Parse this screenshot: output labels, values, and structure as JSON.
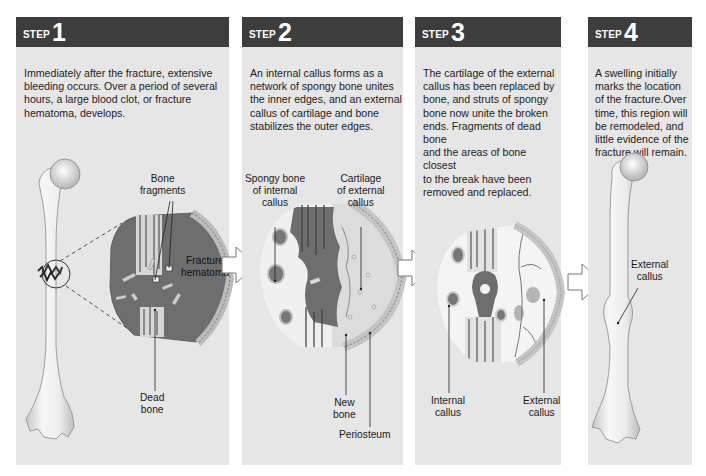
{
  "steps": [
    {
      "word": "STEP",
      "number": "1",
      "text_lines": [
        "Immediately after the fracture, extensive",
        "bleeding occurs. Over a period of several",
        "hours, a large blood clot, or fracture",
        "hematoma, develops."
      ],
      "labels": {
        "bone_fragments": [
          "Bone",
          "fragments"
        ],
        "fracture_hematoma": [
          "Fracture",
          "hematoma"
        ],
        "dead_bone": [
          "Dead",
          "bone"
        ]
      }
    },
    {
      "word": "STEP",
      "number": "2",
      "text_lines": [
        "An internal callus forms as a",
        "network of spongy bone unites",
        "the inner edges, and an external",
        "callus of cartilage and bone",
        "stabilizes the outer edges."
      ],
      "labels": {
        "spongy_bone": [
          "Spongy bone",
          "of internal",
          "callus"
        ],
        "cartilage": [
          "Cartilage",
          "of external",
          "callus"
        ],
        "new_bone": [
          "New",
          "bone"
        ],
        "periosteum": [
          "Periosteum"
        ]
      }
    },
    {
      "word": "STEP",
      "number": "3",
      "text_lines": [
        "The cartilage of the external",
        "callus has been replaced by",
        "bone, and struts of spongy",
        "bone now unite the broken",
        "ends. Fragments of dead bone",
        "and the areas of bone closest",
        "to the break have been",
        "removed and replaced."
      ],
      "labels": {
        "internal_callus": [
          "Internal",
          "callus"
        ],
        "external_callus": [
          "External",
          "callus"
        ]
      }
    },
    {
      "word": "STEP",
      "number": "4",
      "text_lines": [
        "A swelling initially",
        "marks the location",
        "of the fracture.Over",
        "time, this region will",
        "be remodeled, and",
        "little evidence of the",
        "fracture will remain."
      ],
      "labels": {
        "external_callus": [
          "External",
          "callus"
        ]
      }
    }
  ],
  "arrows": [
    "right-arrow-icon",
    "right-arrow-icon",
    "right-arrow-icon"
  ],
  "colors": {
    "header_bg": "#3d3d3d",
    "panel_bg": "#e6e6e6",
    "hematoma": "#6e6e6e",
    "bone": "#f2f2f2"
  }
}
